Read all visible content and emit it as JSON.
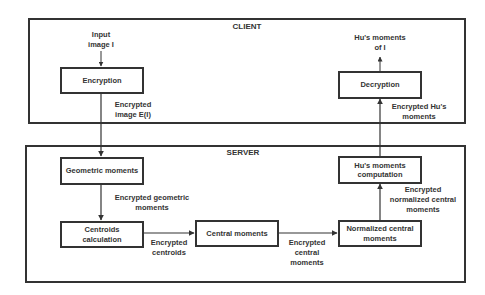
{
  "regions": {
    "client": {
      "title": "CLIENT"
    },
    "server": {
      "title": "SERVER"
    }
  },
  "nodes": {
    "encryption": "Encryption",
    "decryption": "Decryption",
    "geometric_moments": "Geometric moments",
    "centroids_calculation": "Centroids\ncalculation",
    "central_moments": "Central moments",
    "normalized_central_moments": "Normalized central\nmoments",
    "hus_moments_computation": "Hu's moments\ncomputation"
  },
  "edge_labels": {
    "input": "Input\nimage I",
    "output": "Hu's moments\nof I",
    "encrypted_image": "Encrypted\nimage E(I)",
    "encrypted_hus_moments": "Encrypted Hu's\nmoments",
    "encrypted_geometric_moments": "Encrypted geometric\nmoments",
    "encrypted_centroids": "Encrypted\ncentroids",
    "encrypted_central_moments": "Encrypted\ncentral\nmoments",
    "encrypted_normalized_central_moments": "Encrypted\nnormalized central\nmoments"
  },
  "colors": {
    "stroke": "#333333",
    "background": "#ffffff"
  }
}
